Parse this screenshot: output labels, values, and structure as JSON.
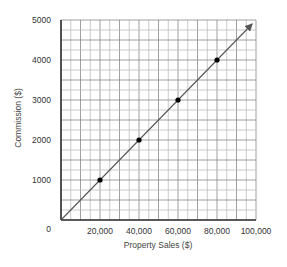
{
  "chart_data": {
    "type": "line",
    "title": "",
    "xlabel": "Property Sales ($)",
    "ylabel": "Commission ($)",
    "xlim": [
      0,
      100000
    ],
    "ylim": [
      0,
      5000
    ],
    "x_ticks": [
      20000,
      40000,
      60000,
      80000,
      100000
    ],
    "x_tick_labels": [
      "20,000",
      "40,000",
      "60,000",
      "80,000",
      "100,000"
    ],
    "y_ticks": [
      0,
      1000,
      2000,
      3000,
      4000,
      5000
    ],
    "y_tick_labels": [
      "0",
      "1000",
      "2000",
      "3000",
      "4000",
      "5000"
    ],
    "grid": true,
    "grid_minor_x_step": 5000,
    "grid_minor_y_step": 250,
    "legend": null,
    "series": [
      {
        "name": "Commission",
        "line": {
          "from": [
            0,
            0
          ],
          "to": [
            98000,
            4900
          ],
          "arrow": true
        },
        "points": [
          {
            "x": 20000,
            "y": 1000
          },
          {
            "x": 40000,
            "y": 2000
          },
          {
            "x": 60000,
            "y": 3000
          },
          {
            "x": 80000,
            "y": 4000
          }
        ]
      }
    ]
  },
  "colors": {
    "line": "#555555",
    "points": "#000000",
    "grid_minor": "#bdbdbd",
    "grid_major": "#888888",
    "axis": "#333333"
  }
}
